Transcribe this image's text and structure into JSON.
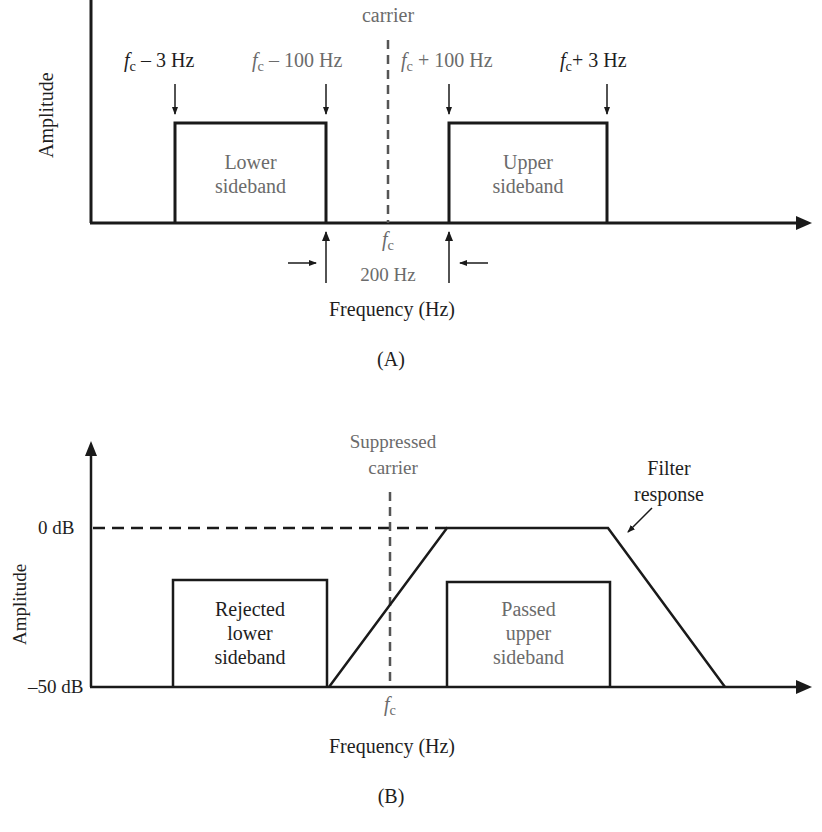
{
  "panel_a": {
    "caption": "(A)",
    "y_axis_label": "Amplitude",
    "x_axis_label": "Frequency (Hz)",
    "carrier_label": "carrier",
    "fc_symbol": "f",
    "fc_sub": "c",
    "markers": [
      {
        "prefix": "f",
        "sub": "c",
        "text": " – 3 Hz"
      },
      {
        "prefix": "f",
        "sub": "c",
        "text": " – 100 Hz"
      },
      {
        "prefix": "f",
        "sub": "c",
        "text": " + 100 Hz"
      },
      {
        "prefix": "f",
        "sub": "c",
        "text": "+ 3 Hz"
      }
    ],
    "lower_box": {
      "line1": "Lower",
      "line2": "sideband"
    },
    "upper_box": {
      "line1": "Upper",
      "line2": "sideband"
    },
    "gap_label": "200 Hz"
  },
  "panel_b": {
    "caption": "(B)",
    "y_axis_label": "Amplitude",
    "x_axis_label": "Frequency (Hz)",
    "y_ticks": [
      "0 dB",
      "–50 dB"
    ],
    "carrier_label_line1": "Suppressed",
    "carrier_label_line2": "carrier",
    "fc_symbol": "f",
    "fc_sub": "c",
    "filter_label_line1": "Filter",
    "filter_label_line2": "response",
    "rejected_box": {
      "line1": "Rejected",
      "line2": "lower",
      "line3": "sideband"
    },
    "passed_box": {
      "line1": "Passed",
      "line2": "upper",
      "line3": "sideband"
    }
  },
  "colors": {
    "line": "#1a1a1a",
    "gray_text": "#6b6b6b",
    "dashed": "#555555"
  }
}
